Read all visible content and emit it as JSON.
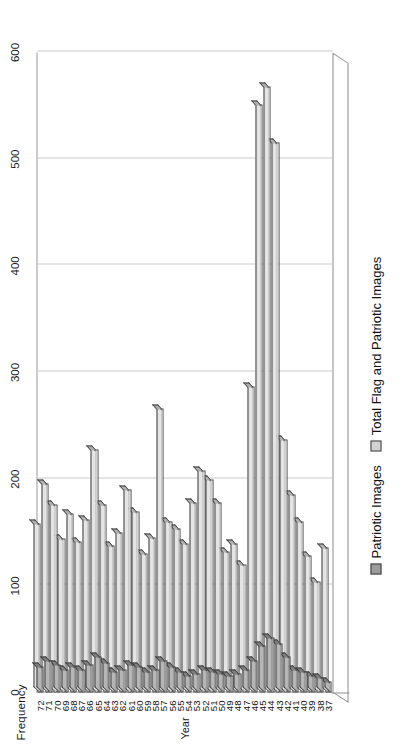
{
  "chart_data": {
    "type": "bar",
    "orientation": "horizontal-rotated",
    "title": "",
    "xlabel": "Year",
    "ylabel": "Frequency",
    "ylim": [
      0,
      600
    ],
    "yticks": [
      0,
      100,
      200,
      300,
      400,
      500,
      600
    ],
    "grid": true,
    "legend_position": "bottom",
    "categories": [
      "37",
      "38",
      "39",
      "40",
      "41",
      "42",
      "43",
      "44",
      "45",
      "46",
      "47",
      "48",
      "49",
      "50",
      "51",
      "52",
      "53",
      "54",
      "55",
      "56",
      "57",
      "58",
      "59",
      "60",
      "61",
      "62",
      "63",
      "64",
      "65",
      "66",
      "67",
      "68",
      "69",
      "70",
      "71",
      "72"
    ],
    "series": [
      {
        "name": "Patriotic Images",
        "color": "#9d9d9d",
        "values": [
          10,
          14,
          16,
          20,
          22,
          34,
          46,
          52,
          44,
          30,
          22,
          18,
          16,
          18,
          20,
          22,
          18,
          16,
          20,
          24,
          30,
          22,
          20,
          24,
          26,
          22,
          20,
          28,
          34,
          26,
          22,
          24,
          22,
          26,
          30,
          24
        ]
      },
      {
        "name": "Total Flag and Patriotic Images",
        "color": "#d2d2d2",
        "values": [
          136,
          104,
          128,
          160,
          186,
          237,
          516,
          568,
          551,
          287,
          120,
          140,
          132,
          178,
          200,
          208,
          178,
          140,
          154,
          160,
          266,
          145,
          130,
          170,
          190,
          150,
          138,
          176,
          228,
          162,
          142,
          168,
          144,
          176,
          196,
          158
        ]
      }
    ]
  },
  "axis": {
    "value_title": "Frequency",
    "category_title": "Year"
  },
  "legend": {
    "items": [
      {
        "label": "Patriotic Images",
        "swatch": "legend-swatch-patriotic"
      },
      {
        "label": "Total Flag and Patriotic Images",
        "swatch": "legend-swatch-total"
      }
    ]
  }
}
